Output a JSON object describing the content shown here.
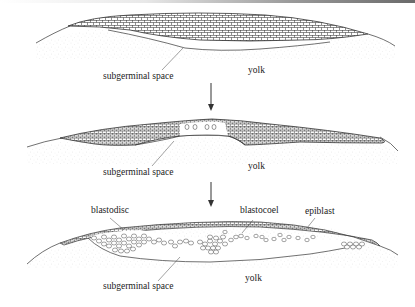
{
  "figure": {
    "stages": [
      {
        "index": 1,
        "labels": {
          "subgerminal_space": "subgerminal space",
          "yolk": "yolk"
        }
      },
      {
        "index": 2,
        "labels": {
          "subgerminal_space": "subgerminal space",
          "yolk": "yolk"
        }
      },
      {
        "index": 3,
        "labels": {
          "blastodisc": "blastodisc",
          "blastocoel": "blastocoel",
          "epiblast": "epiblast",
          "subgerminal_space": "subgerminal space",
          "yolk": "yolk"
        }
      }
    ],
    "arrows": [
      "stage-1-to-2",
      "stage-2-to-3"
    ],
    "colors": {
      "line": "#2a2a2a",
      "yolk_stipple": "#bdbdbd",
      "background": "#ffffff"
    }
  }
}
